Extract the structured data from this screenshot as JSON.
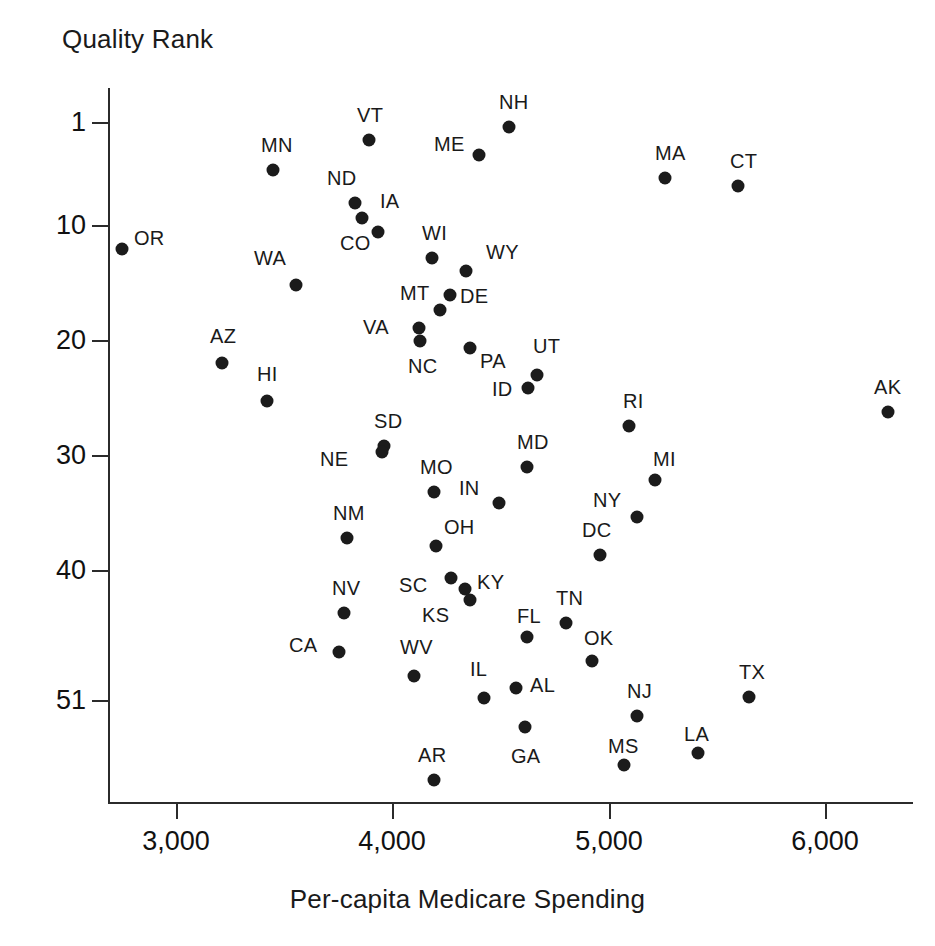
{
  "chart_data": {
    "type": "scatter",
    "title": "",
    "ylabel": "Quality Rank",
    "xlabel": "Per-capita Medicare Spending",
    "xlim": [
      2750,
      6450
    ],
    "ylim": [
      1,
      51
    ],
    "y_inverted": true,
    "grid": false,
    "legend": "none",
    "xticks": [
      3000,
      4000,
      5000,
      6000
    ],
    "xtick_labels": [
      "3,000",
      "4,000",
      "5,000",
      "6,000"
    ],
    "yticks": [
      1,
      10,
      20,
      30,
      40,
      51
    ],
    "ytick_labels": [
      "1",
      "10",
      "20",
      "30",
      "40",
      "51"
    ],
    "point_color": "#1b1b1b",
    "axis_color": "#2b2b2b",
    "points": [
      {
        "label": "OR",
        "x": 2770,
        "y": 10,
        "px": 122,
        "py": 249,
        "lx": 12,
        "ly": -22
      },
      {
        "label": "MN",
        "x": 3450,
        "y": 3,
        "px": 273,
        "py": 170,
        "lx": -12,
        "ly": -36
      },
      {
        "label": "VT",
        "x": 3955,
        "y": 2,
        "px": 369,
        "py": 140,
        "lx": -12,
        "ly": -36
      },
      {
        "label": "NH",
        "x": 4555,
        "y": 1,
        "px": 509,
        "py": 127,
        "lx": -10,
        "ly": -36
      },
      {
        "label": "ME",
        "x": 4400,
        "y": 3,
        "px": 479,
        "py": 155,
        "lx": -45,
        "ly": -22
      },
      {
        "label": "MA",
        "x": 5230,
        "y": 4,
        "px": 665,
        "py": 178,
        "lx": -10,
        "ly": -36
      },
      {
        "label": "CT",
        "x": 5620,
        "y": 5,
        "px": 738,
        "py": 186,
        "lx": -8,
        "ly": -36
      },
      {
        "label": "ND",
        "x": 4100,
        "y": 7,
        "px": 355,
        "py": 203,
        "lx": -28,
        "ly": -36
      },
      {
        "label": "IA",
        "x": 4145,
        "y": 9,
        "px": 378,
        "py": 232,
        "lx": 2,
        "ly": -42
      },
      {
        "label": "CO",
        "x": 4105,
        "y": 8,
        "px": 362,
        "py": 218,
        "lx": -22,
        "ly": 14
      },
      {
        "label": "WA",
        "x": 3450,
        "y": 12,
        "px": 296,
        "py": 285,
        "lx": -42,
        "ly": -38
      },
      {
        "label": "WI",
        "x": 4310,
        "y": 11,
        "px": 432,
        "py": 258,
        "lx": -10,
        "ly": -36
      },
      {
        "label": "WY",
        "x": 4470,
        "y": 12,
        "px": 466,
        "py": 271,
        "lx": 20,
        "ly": -30
      },
      {
        "label": "DE",
        "x": 4395,
        "y": 14,
        "px": 450,
        "py": 295,
        "lx": 10,
        "ly": -10
      },
      {
        "label": "MT",
        "x": 4350,
        "y": 15,
        "px": 440,
        "py": 310,
        "lx": -40,
        "ly": -28
      },
      {
        "label": "VA",
        "x": 4255,
        "y": 16,
        "px": 419,
        "py": 328,
        "lx": -56,
        "ly": -12
      },
      {
        "label": "NC",
        "x": 4260,
        "y": 17,
        "px": 420,
        "py": 341,
        "lx": -12,
        "ly": 14
      },
      {
        "label": "PA",
        "x": 4465,
        "y": 18,
        "px": 470,
        "py": 348,
        "lx": 10,
        "ly": 2
      },
      {
        "label": "AZ",
        "x": 3230,
        "y": 19,
        "px": 222,
        "py": 363,
        "lx": -12,
        "ly": -38
      },
      {
        "label": "HI",
        "x": 3440,
        "y": 22,
        "px": 267,
        "py": 401,
        "lx": -10,
        "ly": -38
      },
      {
        "label": "UT",
        "x": 4665,
        "y": 20,
        "px": 537,
        "py": 375,
        "lx": -4,
        "ly": -40
      },
      {
        "label": "ID",
        "x": 4625,
        "y": 21,
        "px": 528,
        "py": 388,
        "lx": -36,
        "ly": -10
      },
      {
        "label": "RI",
        "x": 5075,
        "y": 23,
        "px": 629,
        "py": 426,
        "lx": -6,
        "ly": -36
      },
      {
        "label": "AK",
        "x": 6290,
        "y": 22,
        "px": 888,
        "py": 412,
        "lx": -14,
        "ly": -36
      },
      {
        "label": "SD",
        "x": 3975,
        "y": 25,
        "px": 384,
        "py": 446,
        "lx": -10,
        "ly": -36
      },
      {
        "label": "NE",
        "x": 3965,
        "y": 26,
        "px": 382,
        "py": 452,
        "lx": -62,
        "ly": -4
      },
      {
        "label": "MD",
        "x": 4680,
        "y": 27,
        "px": 527,
        "py": 467,
        "lx": -10,
        "ly": -36
      },
      {
        "label": "MI",
        "x": 5250,
        "y": 28,
        "px": 655,
        "py": 480,
        "lx": -2,
        "ly": -32
      },
      {
        "label": "MO",
        "x": 4215,
        "y": 29,
        "px": 434,
        "py": 492,
        "lx": -14,
        "ly": -36
      },
      {
        "label": "IN",
        "x": 4635,
        "y": 30,
        "px": 499,
        "py": 503,
        "lx": -40,
        "ly": -26
      },
      {
        "label": "NY",
        "x": 5130,
        "y": 30,
        "px": 637,
        "py": 517,
        "lx": -44,
        "ly": -28
      },
      {
        "label": "NM",
        "x": 3795,
        "y": 32,
        "px": 347,
        "py": 538,
        "lx": -14,
        "ly": -36
      },
      {
        "label": "OH",
        "x": 4315,
        "y": 33,
        "px": 436,
        "py": 546,
        "lx": 8,
        "ly": -30
      },
      {
        "label": "DC",
        "x": 4950,
        "y": 33,
        "px": 600,
        "py": 555,
        "lx": -18,
        "ly": -36
      },
      {
        "label": "SC",
        "x": 4375,
        "y": 35,
        "px": 451,
        "py": 578,
        "lx": -52,
        "ly": -4
      },
      {
        "label": "KY",
        "x": 4430,
        "y": 36,
        "px": 465,
        "py": 589,
        "lx": 12,
        "ly": -18
      },
      {
        "label": "NV",
        "x": 3780,
        "y": 38,
        "px": 344,
        "py": 613,
        "lx": -12,
        "ly": -36
      },
      {
        "label": "KS",
        "x": 4450,
        "y": 37,
        "px": 470,
        "py": 600,
        "lx": -48,
        "ly": 4
      },
      {
        "label": "TN",
        "x": 4810,
        "y": 39,
        "px": 566,
        "py": 623,
        "lx": -10,
        "ly": -36
      },
      {
        "label": "FL",
        "x": 4635,
        "y": 40,
        "px": 527,
        "py": 637,
        "lx": -10,
        "ly": -32
      },
      {
        "label": "CA",
        "x": 3760,
        "y": 41,
        "px": 339,
        "py": 652,
        "lx": -50,
        "ly": -18
      },
      {
        "label": "OK",
        "x": 4910,
        "y": 42,
        "px": 592,
        "py": 661,
        "lx": -8,
        "ly": -34
      },
      {
        "label": "WV",
        "x": 4115,
        "y": 43,
        "px": 414,
        "py": 676,
        "lx": -14,
        "ly": -40
      },
      {
        "label": "AL",
        "x": 4585,
        "y": 44,
        "px": 516,
        "py": 688,
        "lx": 14,
        "ly": -14
      },
      {
        "label": "TX",
        "x": 5660,
        "y": 44,
        "px": 749,
        "py": 697,
        "lx": -10,
        "ly": -36
      },
      {
        "label": "IL",
        "x": 4440,
        "y": 45,
        "px": 484,
        "py": 698,
        "lx": -14,
        "ly": -40
      },
      {
        "label": "GA",
        "x": 4555,
        "y": 47,
        "px": 525,
        "py": 727,
        "lx": -14,
        "ly": 18
      },
      {
        "label": "NJ",
        "x": 5130,
        "y": 46,
        "px": 637,
        "py": 716,
        "lx": -10,
        "ly": -36
      },
      {
        "label": "LA",
        "x": 5430,
        "y": 48,
        "px": 698,
        "py": 753,
        "lx": -14,
        "ly": -30
      },
      {
        "label": "MS",
        "x": 5100,
        "y": 50,
        "px": 624,
        "py": 765,
        "lx": -16,
        "ly": -30
      },
      {
        "label": "AR",
        "x": 4205,
        "y": 51,
        "px": 434,
        "py": 780,
        "lx": -16,
        "ly": -36
      }
    ],
    "tick_px": {
      "x": [
        {
          "v": "3,000",
          "px": 176
        },
        {
          "v": "4,000",
          "px": 392
        },
        {
          "v": "5,000",
          "px": 609
        },
        {
          "v": "6,000",
          "px": 825
        }
      ],
      "y": [
        {
          "v": "1",
          "py": 122
        },
        {
          "v": "10",
          "py": 225
        },
        {
          "v": "20",
          "py": 340
        },
        {
          "v": "30",
          "py": 455
        },
        {
          "v": "40",
          "py": 570
        },
        {
          "v": "51",
          "py": 700
        }
      ]
    }
  }
}
